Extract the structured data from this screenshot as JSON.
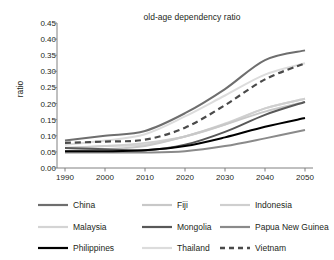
{
  "chart_data": {
    "type": "line",
    "title": "old-age dependency ratio",
    "xlabel": "",
    "ylabel": "ratio",
    "x": [
      1990,
      2000,
      2010,
      2020,
      2030,
      2040,
      2050
    ],
    "xlim": [
      1988,
      2052
    ],
    "ylim": [
      0.0,
      0.45
    ],
    "yticks": [
      0.0,
      0.05,
      0.1,
      0.15,
      0.2,
      0.25,
      0.3,
      0.35,
      0.4,
      0.45
    ],
    "ytick_labels": [
      "0.00",
      "0.05",
      "0.10",
      "0.15",
      "0.20",
      "0.25",
      "0.30",
      "0.35",
      "0.40",
      "0.45"
    ],
    "xticks": [
      1990,
      2000,
      2010,
      2020,
      2030,
      2040,
      2050
    ],
    "xtick_labels": [
      "1990",
      "2000",
      "2010",
      "2020",
      "2030",
      "2040",
      "2050"
    ],
    "grid": false,
    "legend_position": "below",
    "series": [
      {
        "name": "China",
        "color": "#6e6e6e",
        "style": "solid",
        "width": 2.0,
        "values": [
          0.085,
          0.1,
          0.115,
          0.17,
          0.245,
          0.335,
          0.365
        ]
      },
      {
        "name": "Fiji",
        "color": "#c8c8c8",
        "style": "solid",
        "width": 2.0,
        "values": [
          0.053,
          0.058,
          0.068,
          0.098,
          0.135,
          0.175,
          0.205
        ]
      },
      {
        "name": "Indonesia",
        "color": "#cfcfcf",
        "style": "solid",
        "width": 2.0,
        "values": [
          0.062,
          0.068,
          0.078,
          0.098,
          0.135,
          0.185,
          0.215
        ]
      },
      {
        "name": "Malaysia",
        "color": "#d4d4d4",
        "style": "solid",
        "width": 2.0,
        "values": [
          0.063,
          0.068,
          0.073,
          0.098,
          0.138,
          0.185,
          0.215
        ]
      },
      {
        "name": "Mongolia",
        "color": "#585858",
        "style": "solid",
        "width": 2.0,
        "values": [
          0.062,
          0.058,
          0.055,
          0.072,
          0.112,
          0.165,
          0.205
        ]
      },
      {
        "name": "Papua New Guinea",
        "color": "#8a8a8a",
        "style": "solid",
        "width": 2.0,
        "values": [
          0.048,
          0.048,
          0.048,
          0.052,
          0.068,
          0.092,
          0.118
        ]
      },
      {
        "name": "Philippines",
        "color": "#000000",
        "style": "solid",
        "width": 2.0,
        "values": [
          0.052,
          0.052,
          0.055,
          0.068,
          0.095,
          0.128,
          0.155
        ]
      },
      {
        "name": "Thailand",
        "color": "#dcdcdc",
        "style": "solid",
        "width": 2.0,
        "values": [
          0.072,
          0.085,
          0.105,
          0.16,
          0.225,
          0.29,
          0.325
        ]
      },
      {
        "name": "Vietnam",
        "color": "#4a4a4a",
        "style": "dashed",
        "width": 2.2,
        "values": [
          0.078,
          0.082,
          0.088,
          0.125,
          0.195,
          0.275,
          0.325
        ]
      }
    ]
  },
  "legend": {
    "rows": [
      [
        {
          "label": "China",
          "series": "China"
        },
        {
          "label": "Fiji",
          "series": "Fiji"
        },
        {
          "label": "Indonesia",
          "series": "Indonesia"
        }
      ],
      [
        {
          "label": "Malaysia",
          "series": "Malaysia"
        },
        {
          "label": "Mongolia",
          "series": "Mongolia"
        },
        {
          "label": "Papua New Guinea",
          "series": "Papua New Guinea"
        }
      ],
      [
        {
          "label": "Philippines",
          "series": "Philippines"
        },
        {
          "label": "Thailand",
          "series": "Thailand"
        },
        {
          "label": "Vietnam",
          "series": "Vietnam"
        }
      ]
    ]
  },
  "axis_style": {
    "axis_color": "#808080",
    "tick_color": "#808080"
  }
}
